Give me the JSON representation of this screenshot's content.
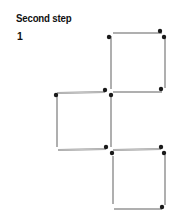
{
  "header": {
    "title": "Second step",
    "step_number": "1"
  },
  "figure": {
    "stick_color": "#cfcfcf",
    "stick_edge_color": "#9a9a9a",
    "head_color": "#1a1a1a",
    "sticks": [
      {
        "id": "top-square-top",
        "x1": 113,
        "y1": 33,
        "x2": 162,
        "y2": 33
      },
      {
        "id": "top-square-left",
        "x1": 111,
        "y1": 36,
        "x2": 111,
        "y2": 89
      },
      {
        "id": "top-square-right",
        "x1": 165,
        "y1": 37,
        "x2": 165,
        "y2": 88
      },
      {
        "id": "top-square-bottom",
        "x1": 113,
        "y1": 92,
        "x2": 162,
        "y2": 92
      },
      {
        "id": "middle-square-top",
        "x1": 57,
        "y1": 93,
        "x2": 105,
        "y2": 92
      },
      {
        "id": "middle-square-left",
        "x1": 57,
        "y1": 96,
        "x2": 57,
        "y2": 147
      },
      {
        "id": "middle-square-right",
        "x1": 111,
        "y1": 96,
        "x2": 111,
        "y2": 147
      },
      {
        "id": "middle-square-bottom",
        "x1": 58,
        "y1": 150,
        "x2": 106,
        "y2": 149
      },
      {
        "id": "bottom-square-top",
        "x1": 113,
        "y1": 150,
        "x2": 161,
        "y2": 149
      },
      {
        "id": "bottom-square-left",
        "x1": 113,
        "y1": 156,
        "x2": 113,
        "y2": 204
      },
      {
        "id": "bottom-square-right",
        "x1": 165,
        "y1": 155,
        "x2": 165,
        "y2": 205
      },
      {
        "id": "bottom-square-bottom",
        "x1": 114,
        "y1": 209,
        "x2": 162,
        "y2": 209
      }
    ],
    "heads": [
      {
        "cx": 109,
        "cy": 37
      },
      {
        "cx": 160,
        "cy": 31
      },
      {
        "cx": 164,
        "cy": 37
      },
      {
        "cx": 161,
        "cy": 89
      },
      {
        "cx": 56,
        "cy": 95
      },
      {
        "cx": 105,
        "cy": 90
      },
      {
        "cx": 111,
        "cy": 95
      },
      {
        "cx": 106,
        "cy": 147
      },
      {
        "cx": 112,
        "cy": 153
      },
      {
        "cx": 161,
        "cy": 147
      },
      {
        "cx": 164,
        "cy": 153
      },
      {
        "cx": 162,
        "cy": 207
      }
    ]
  }
}
